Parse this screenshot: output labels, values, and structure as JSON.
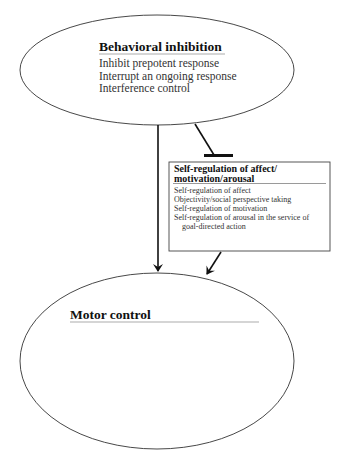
{
  "diagram": {
    "nodes": {
      "behavioral_inhibition": {
        "title": "Behavioral inhibition",
        "items": [
          "Inhibit prepotent response",
          "Interrupt an ongoing response",
          "Interference control"
        ]
      },
      "self_regulation": {
        "title_line1": "Self-regulation of affect/",
        "title_line2": "motivation/arousal",
        "items": [
          "Self-regulation of affect",
          "Objectivity/social perspective taking",
          "Self-regulation of motivation",
          "Self-regulation of arousal in the service of",
          "goal-directed action"
        ]
      },
      "motor_control": {
        "title": "Motor control"
      }
    },
    "edges": [
      {
        "from": "Behavioral inhibition",
        "to": "Motor control",
        "type": "arrow"
      },
      {
        "from": "Behavioral inhibition",
        "to": "Self-regulation of affect/motivation/arousal",
        "type": "inhibition (flat bar)"
      },
      {
        "from": "Self-regulation of affect/motivation/arousal",
        "to": "Motor control",
        "type": "arrow"
      }
    ],
    "colors": {
      "stroke": "#222222",
      "background": "#ffffff",
      "text": "#222222"
    }
  }
}
